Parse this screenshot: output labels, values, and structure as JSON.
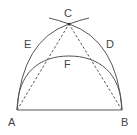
{
  "diagram": {
    "type": "geometric-construction",
    "colors": {
      "stroke": "#555555",
      "background": "#ffffff",
      "label": "#444444"
    },
    "points": {
      "A": {
        "label": "A",
        "x": 17,
        "y": 110
      },
      "B": {
        "label": "B",
        "x": 122,
        "y": 110
      },
      "C": {
        "label": "C",
        "x": 69,
        "y": 24
      },
      "D": {
        "label": "D"
      },
      "E": {
        "label": "E"
      },
      "F": {
        "label": "F"
      }
    },
    "labels": {
      "A": "A",
      "B": "B",
      "C": "C",
      "D": "D",
      "E": "E",
      "F": "F"
    },
    "elements": [
      {
        "name": "segment-AB",
        "style": "solid"
      },
      {
        "name": "segment-AC",
        "style": "dashed"
      },
      {
        "name": "segment-BC",
        "style": "dashed"
      },
      {
        "name": "arc-ACB-outer",
        "style": "solid",
        "through": [
          "A",
          "E",
          "C",
          "D",
          "B"
        ]
      },
      {
        "name": "arc-AFB-inner",
        "style": "solid",
        "through": [
          "A",
          "F",
          "B"
        ]
      }
    ]
  }
}
